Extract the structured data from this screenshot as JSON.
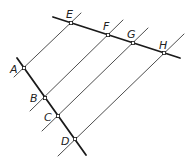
{
  "diagram": {
    "colors": {
      "line": "#1a1a1a",
      "thin_line": "#3a3a3a",
      "label": "#222222",
      "background": "#ffffff"
    },
    "thick_lines": [
      {
        "name": "line-ad",
        "x1": 17,
        "y1": 58,
        "x2": 86,
        "y2": 155
      },
      {
        "name": "line-eh",
        "x1": 53,
        "y1": 17,
        "x2": 180,
        "y2": 58
      }
    ],
    "thin_lines": [
      {
        "name": "line-ae",
        "x1": 14,
        "y1": 77,
        "x2": 81,
        "y2": 13
      },
      {
        "name": "line-bf",
        "x1": 30,
        "y1": 111,
        "x2": 123,
        "y2": 20
      },
      {
        "name": "line-cg",
        "x1": 42,
        "y1": 131,
        "x2": 148,
        "y2": 28
      },
      {
        "name": "line-dh",
        "x1": 58,
        "y1": 156,
        "x2": 184,
        "y2": 34
      }
    ],
    "points": [
      {
        "label": "A",
        "x": 24,
        "y": 68,
        "lx": 10,
        "ly": 73
      },
      {
        "label": "B",
        "x": 45,
        "y": 98,
        "lx": 30,
        "ly": 102
      },
      {
        "label": "C",
        "x": 58,
        "y": 116,
        "lx": 44,
        "ly": 121
      },
      {
        "label": "D",
        "x": 75,
        "y": 139,
        "lx": 61,
        "ly": 145
      },
      {
        "label": "E",
        "x": 71,
        "y": 23,
        "lx": 66,
        "ly": 18
      },
      {
        "label": "F",
        "x": 108,
        "y": 35,
        "lx": 103,
        "ly": 30
      },
      {
        "label": "G",
        "x": 133,
        "y": 43,
        "lx": 127,
        "ly": 38
      },
      {
        "label": "H",
        "x": 164,
        "y": 53,
        "lx": 159,
        "ly": 49
      }
    ]
  }
}
